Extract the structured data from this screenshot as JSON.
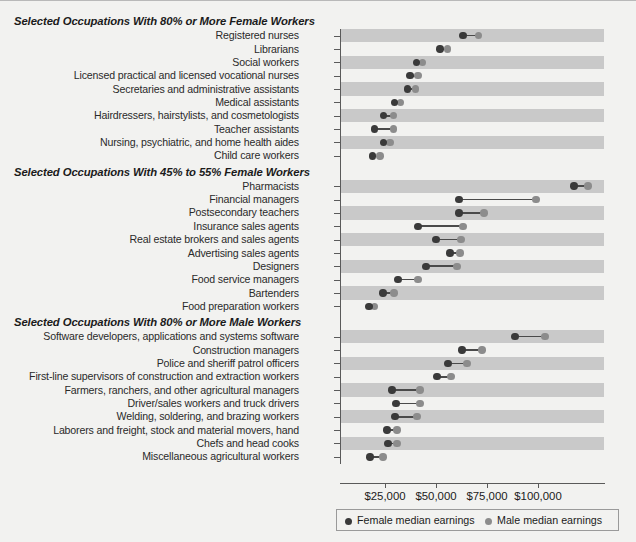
{
  "chart_data": {
    "type": "scatter",
    "subtype": "dumbbell",
    "title": "",
    "xlabel": "",
    "ylabel": "",
    "xlim": [
      0,
      126000
    ],
    "xticks": [
      25000,
      50000,
      75000,
      100000
    ],
    "xtick_labels": [
      "$25,000",
      "$50,000",
      "$75,000",
      "$100,000"
    ],
    "grid": false,
    "legend_position": "bottom",
    "series": [
      {
        "name": "Female median earnings",
        "color": "#3a3a3a"
      },
      {
        "name": "Male median earnings",
        "color": "#8c8c8c"
      }
    ],
    "groups": [
      {
        "header": "Selected Occupations With 80% or More Female Workers",
        "rows": [
          {
            "label": "Registered nurses",
            "female": 63300,
            "male": 70800
          },
          {
            "label": "Librarians",
            "female": 52000,
            "male": 55500
          },
          {
            "label": "Social workers",
            "female": 40500,
            "male": 43300
          },
          {
            "label": "Licensed practical and licensed vocational nurses",
            "female": 37200,
            "male": 41200
          },
          {
            "label": "Secretaries and administrative assistants",
            "female": 36000,
            "male": 40000
          },
          {
            "label": "Medical assistants",
            "female": 29600,
            "male": 32500
          },
          {
            "label": "Hairdressers, hairstylists, and cosmetologists",
            "female": 24200,
            "male": 29100
          },
          {
            "label": "Teacher assistants",
            "female": 20000,
            "male": 29100
          },
          {
            "label": "Nursing, psychiatric, and home health aides",
            "female": 24200,
            "male": 27500
          },
          {
            "label": "Child care workers",
            "female": 19000,
            "male": 22500
          }
        ]
      },
      {
        "header": "Selected Occupations With 45% to 55% Female Workers",
        "rows": [
          {
            "label": "Pharmacists",
            "female": 117600,
            "male": 124500
          },
          {
            "label": "Financial managers",
            "female": 61300,
            "male": 99000
          },
          {
            "label": "Postsecondary teachers",
            "female": 61300,
            "male": 73500
          },
          {
            "label": "Insurance sales agents",
            "female": 41200,
            "male": 63300
          },
          {
            "label": "Real estate brokers and sales agents",
            "female": 50000,
            "male": 62300
          },
          {
            "label": "Advertising sales agents",
            "female": 56900,
            "male": 61800
          },
          {
            "label": "Designers",
            "female": 45100,
            "male": 60300
          },
          {
            "label": "Food service managers",
            "female": 31400,
            "male": 41200
          },
          {
            "label": "Bartenders",
            "female": 24000,
            "male": 29400
          },
          {
            "label": "Food preparation workers",
            "female": 17100,
            "male": 20000
          }
        ]
      },
      {
        "header": "Selected Occupations With 80% or More Male Workers",
        "rows": [
          {
            "label": "Software developers, applications and systems software",
            "female": 88700,
            "male": 103400
          },
          {
            "label": "Construction managers",
            "female": 62700,
            "male": 72500
          },
          {
            "label": "Police and sheriff patrol officers",
            "female": 55900,
            "male": 65200
          },
          {
            "label": "First-line supervisors of construction and extraction workers",
            "female": 50500,
            "male": 57400
          },
          {
            "label": "Farmers, ranchers, and other agricultural managers",
            "female": 28400,
            "male": 42200
          },
          {
            "label": "Driver/sales workers and truck drivers",
            "female": 30400,
            "male": 42200
          },
          {
            "label": "Welding, soldering, and brazing workers",
            "female": 29900,
            "male": 40700
          },
          {
            "label": "Laborers and freight, stock and material movers, hand",
            "female": 25900,
            "male": 30900
          },
          {
            "label": "Chefs and head cooks",
            "female": 26500,
            "male": 30900
          },
          {
            "label": "Miscellaneous agricultural workers",
            "female": 17600,
            "male": 24000
          }
        ]
      }
    ]
  }
}
